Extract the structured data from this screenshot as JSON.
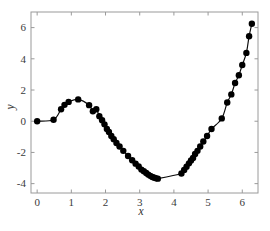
{
  "chart_data": {
    "type": "line",
    "title": "",
    "subtitle": "",
    "xlabel": "x",
    "ylabel": "y",
    "xlim": [
      -0.18,
      6.46
    ],
    "ylim": [
      -4.6,
      7.0
    ],
    "xticks": [
      0,
      1,
      2,
      3,
      4,
      5,
      6
    ],
    "yticks": [
      -4,
      -2,
      0,
      2,
      4,
      6
    ],
    "xticklabels": [
      "0",
      "1",
      "2",
      "3",
      "4",
      "5",
      "6"
    ],
    "yticklabels": [
      "-4",
      "-2",
      "0",
      "2",
      "4",
      "6"
    ],
    "grid": false,
    "legend": null,
    "annotations": [],
    "series": [
      {
        "name": "x - 3 sin(x)",
        "line_color": "#000000",
        "marker": "circle",
        "marker_color": "#000000",
        "marker_size": 5.2,
        "x": [
          0.0,
          0.48,
          0.7,
          0.8,
          0.92,
          1.2,
          1.52,
          1.63,
          1.73,
          1.82,
          1.9,
          1.97,
          2.04,
          2.1,
          2.17,
          2.24,
          2.32,
          2.41,
          2.52,
          2.66,
          2.78,
          2.88,
          2.97,
          3.05,
          3.12,
          3.19,
          3.25,
          3.31,
          3.37,
          3.43,
          3.48,
          3.53,
          4.22,
          4.3,
          4.37,
          4.44,
          4.5,
          4.56,
          4.62,
          4.69,
          4.77,
          4.86,
          4.97,
          5.1,
          5.4,
          5.56,
          5.68,
          5.79,
          5.9,
          6.0,
          6.12,
          6.2,
          6.28
        ],
        "y": [
          0.0,
          0.09,
          0.77,
          1.05,
          1.24,
          1.4,
          1.03,
          0.64,
          0.77,
          0.32,
          0.06,
          -0.2,
          -0.5,
          -0.69,
          -0.95,
          -1.15,
          -1.4,
          -1.62,
          -1.9,
          -2.23,
          -2.5,
          -2.72,
          -2.9,
          -3.1,
          -3.2,
          -3.32,
          -3.42,
          -3.5,
          -3.57,
          -3.62,
          -3.66,
          -3.68,
          -3.35,
          -3.12,
          -2.92,
          -2.7,
          -2.52,
          -2.35,
          -2.1,
          -1.9,
          -1.62,
          -1.3,
          -0.95,
          -0.5,
          0.18,
          1.2,
          1.72,
          2.45,
          2.95,
          3.6,
          4.38,
          5.45,
          6.25
        ]
      }
    ]
  }
}
